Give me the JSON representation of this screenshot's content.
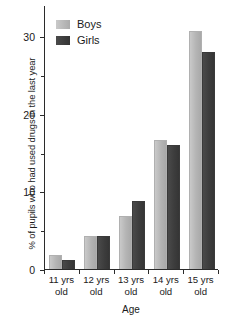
{
  "chart_data": {
    "type": "bar",
    "title": "",
    "subtitle": "",
    "xlabel": "Age",
    "ylabel": "% of pupils who had used drugs in the last year",
    "categories": [
      "11 yrs old",
      "12 yrs old",
      "13 yrs old",
      "14 yrs old",
      "15 yrs old"
    ],
    "category_lines": [
      {
        "line1": "11 yrs",
        "line2": "old"
      },
      {
        "line1": "12 yrs",
        "line2": "old"
      },
      {
        "line1": "13 yrs",
        "line2": "old"
      },
      {
        "line1": "14 yrs",
        "line2": "old"
      },
      {
        "line1": "15 yrs",
        "line2": "old"
      }
    ],
    "series": [
      {
        "name": "Boys",
        "color": "#b8b8b8",
        "values": [
          1.8,
          4.3,
          6.8,
          16.6,
          30.6
        ]
      },
      {
        "name": "Girls",
        "color": "#3d3d3d",
        "values": [
          1.1,
          4.3,
          8.8,
          16.0,
          28.0
        ]
      }
    ],
    "ylim": [
      0,
      34
    ],
    "yticks_major": [
      0,
      10,
      20,
      30
    ],
    "yticks_major_labels": [
      "0",
      "10",
      "20",
      "30"
    ],
    "yticks_minor": [
      5,
      15,
      25
    ],
    "grid": false,
    "legend_position": "top-left-inside"
  },
  "legend": {
    "items": [
      {
        "label": "Boys",
        "swatch": "boys"
      },
      {
        "label": "Girls",
        "swatch": "girls"
      }
    ]
  },
  "axes": {
    "y_title": "% of pupils who had used drugs in the last year",
    "x_title": "Age"
  }
}
